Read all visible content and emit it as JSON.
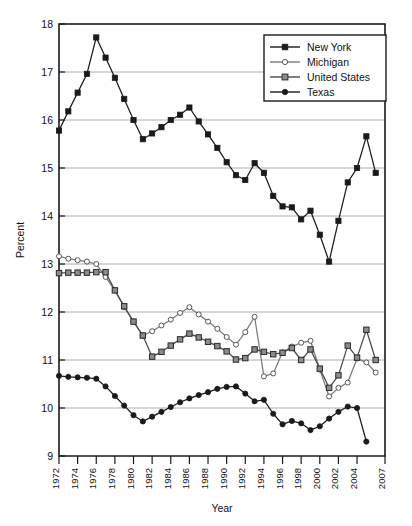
{
  "chart_data": {
    "type": "line",
    "title": "",
    "xlabel": "Year",
    "ylabel": "Percent",
    "ylim": [
      9,
      18
    ],
    "ytick_labels": [
      "9",
      "10",
      "11",
      "12",
      "13",
      "14",
      "15",
      "16",
      "17",
      "18"
    ],
    "yticks": [
      9,
      10,
      11,
      12,
      13,
      14,
      15,
      16,
      17,
      18
    ],
    "grid": "horizontal",
    "legend_position": "top-right",
    "x": [
      1972,
      1973,
      1974,
      1975,
      1976,
      1977,
      1978,
      1979,
      1980,
      1981,
      1982,
      1983,
      1984,
      1985,
      1986,
      1987,
      1988,
      1989,
      1990,
      1991,
      1992,
      1993,
      1994,
      1995,
      1996,
      1997,
      1998,
      1999,
      2000,
      2001,
      2002,
      2003,
      2004,
      2005,
      2006,
      2007
    ],
    "xtick_labels": [
      "1972",
      "1974",
      "1976",
      "1978",
      "1980",
      "1982",
      "1984",
      "1986",
      "1988",
      "1990",
      "1992",
      "1994",
      "1996",
      "1998",
      "2000",
      "2002",
      "2004",
      "2007"
    ],
    "xticks": [
      1972,
      1974,
      1976,
      1978,
      1980,
      1982,
      1984,
      1986,
      1988,
      1990,
      1992,
      1994,
      1996,
      1998,
      2000,
      2002,
      2004,
      2007
    ],
    "series": [
      {
        "name": "New York",
        "marker": "filled-square",
        "color": "#1a1a1a",
        "marker_fill": "#1a1a1a",
        "values": [
          15.78,
          16.18,
          16.57,
          16.96,
          17.72,
          17.3,
          16.88,
          16.44,
          16.0,
          15.6,
          15.72,
          15.85,
          16.0,
          16.11,
          16.26,
          15.97,
          15.7,
          15.42,
          15.12,
          14.85,
          14.75,
          15.1,
          14.9,
          14.42,
          14.2,
          14.18,
          13.93,
          14.11,
          13.61,
          13.05,
          13.9,
          14.7,
          15.0,
          15.66,
          14.9,
          null
        ]
      },
      {
        "name": "Michigan",
        "marker": "open-circle",
        "color": "#7a7a7a",
        "marker_fill": "#ffffff",
        "values": [
          13.16,
          13.11,
          13.08,
          13.05,
          13.0,
          12.73,
          12.45,
          12.1,
          11.8,
          11.51,
          11.6,
          11.72,
          11.84,
          11.98,
          12.1,
          11.95,
          11.8,
          11.65,
          11.48,
          11.32,
          11.58,
          11.9,
          10.66,
          10.72,
          11.16,
          11.28,
          11.36,
          11.4,
          10.8,
          10.24,
          10.42,
          10.53,
          11.03,
          10.95,
          10.74,
          null
        ]
      },
      {
        "name": "United States",
        "marker": "gray-square",
        "color": "#4a4a4a",
        "marker_fill": "#8c8c8c",
        "values": [
          12.81,
          12.82,
          12.82,
          12.82,
          12.83,
          12.83,
          12.45,
          12.12,
          11.8,
          11.51,
          11.07,
          11.17,
          11.3,
          11.43,
          11.55,
          11.47,
          11.38,
          11.29,
          11.18,
          11.01,
          11.04,
          11.22,
          11.17,
          11.12,
          11.15,
          11.25,
          11.0,
          11.22,
          10.82,
          10.42,
          10.68,
          11.3,
          11.05,
          11.63,
          11.0,
          null
        ]
      },
      {
        "name": "Texas",
        "marker": "filled-circle",
        "color": "#1a1a1a",
        "marker_fill": "#1a1a1a",
        "values": [
          10.67,
          10.65,
          10.64,
          10.63,
          10.61,
          10.45,
          10.25,
          10.05,
          9.85,
          9.72,
          9.82,
          9.92,
          10.02,
          10.12,
          10.2,
          10.27,
          10.33,
          10.4,
          10.44,
          10.45,
          10.3,
          10.14,
          10.17,
          9.88,
          9.66,
          9.73,
          9.68,
          9.54,
          9.62,
          9.78,
          9.92,
          10.03,
          10.0,
          9.3,
          null,
          null
        ]
      }
    ]
  },
  "axes": {
    "ylabel": "Percent",
    "xlabel": "Year"
  },
  "legend": {
    "items": [
      {
        "label": "New York"
      },
      {
        "label": "Michigan"
      },
      {
        "label": "United States"
      },
      {
        "label": "Texas"
      }
    ]
  }
}
